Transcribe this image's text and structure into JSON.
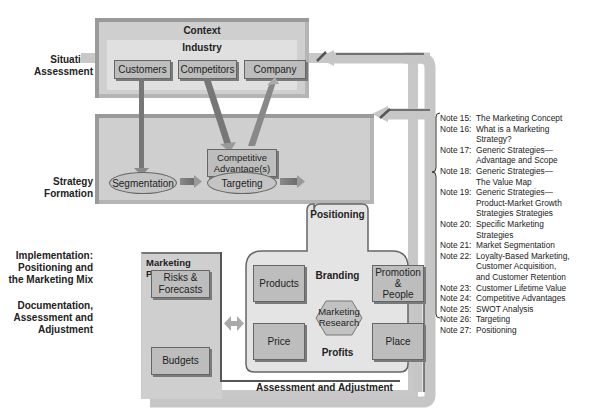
{
  "side_labels": {
    "situation": "Situation\nAssessment",
    "strategy": "Strategy\nFormation",
    "implementation": "Implementation:\nPositioning and\nthe Marketing Mix",
    "documentation": "Documentation,\nAssessment and\nAdjustment"
  },
  "situation_panel": {
    "title": "Context",
    "subtitle": "Industry",
    "boxes": [
      "Customers",
      "Competitors",
      "Company"
    ]
  },
  "strategy_panel": {
    "competitive_advantage": "Competitive\nAdvantage(s)",
    "segmentation": "Segmentation",
    "targeting": "Targeting"
  },
  "positioning_panel": {
    "title": "Positioning",
    "branding": "Branding",
    "profits": "Profits",
    "products": "Products",
    "promotion": "Promotion\n&\nPeople",
    "price": "Price",
    "place": "Place",
    "research": "Marketing\nResearch"
  },
  "plan_panel": {
    "title": "Marketing Plan(s)",
    "risks": "Risks &\nForecasts",
    "budgets": "Budgets"
  },
  "assessment_label": "Assessment and Adjustment",
  "notes": [
    {
      "num": "Note 15:",
      "text": "The Marketing Concept"
    },
    {
      "num": "Note 16:",
      "text": "What is a Marketing\nStrategy?"
    },
    {
      "num": "Note 17:",
      "text": "Generic Strategies—\nAdvantage and Scope"
    },
    {
      "num": "Note 18:",
      "text": "Generic Strategies—\nThe Value Map"
    },
    {
      "num": "Note 19:",
      "text": "Generic Strategies—\nProduct-Market Growth\nStrategies Strategies"
    },
    {
      "num": "Note 20:",
      "text": "Specific Marketing\nStrategies"
    },
    {
      "num": "Note 21:",
      "text": "Market Segmentation"
    },
    {
      "num": "Note 22:",
      "text": "Loyalty-Based Marketing,\nCustomer Acquisition,\nand Customer Retention"
    },
    {
      "num": "Note 23:",
      "text": "Customer Lifetime Value"
    },
    {
      "num": "Note 24:",
      "text": "Competitive Advantages"
    },
    {
      "num": "Note 25:",
      "text": "SWOT Analysis"
    },
    {
      "num": "Note 26:",
      "text": "Targeting"
    },
    {
      "num": "Note 27:",
      "text": "Positioning"
    }
  ],
  "colors": {
    "panel": "#cfcfcf",
    "box": "#bdbdbd",
    "feedback_arrow": "#c8c8c8",
    "text": "#222222"
  }
}
